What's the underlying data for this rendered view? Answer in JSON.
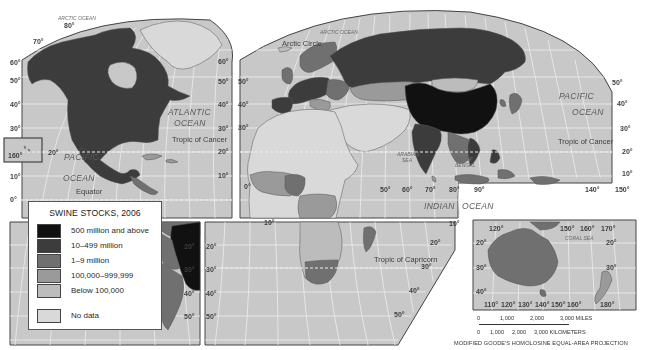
{
  "map": {
    "title": "Swine Stocks, 2006",
    "projection": "MODIFIED GOODE'S HOMOLOSINE EQUAL-AREA PROJECTION",
    "colors": {
      "ocean": "#c8c8c8",
      "graticule": "#eeeeee",
      "border": "#555555",
      "frame": "#444444"
    }
  },
  "legend": {
    "title": "SWINE STOCKS, 2006",
    "items": [
      {
        "label": "500 million and above",
        "color": "#111111"
      },
      {
        "label": "10–499 million",
        "color": "#3c3c3c"
      },
      {
        "label": "1–9 million",
        "color": "#707070"
      },
      {
        "label": "100,000–999,999",
        "color": "#9a9a9a"
      },
      {
        "label": "Below 100,000",
        "color": "#bcbcbc"
      }
    ],
    "no_data": {
      "label": "No data",
      "color": "#d9d9d9"
    }
  },
  "labels": {
    "oceans": {
      "arctic_west": "ARCTIC OCEAN",
      "arctic_east": "ARCTIC OCEAN",
      "atlantic_1": "ATLANTIC",
      "atlantic_2": "OCEAN",
      "pacific_w1": "PACIFIC",
      "pacific_w2": "OCEAN",
      "pacific_e1": "PACIFIC",
      "pacific_e2": "OCEAN",
      "indian_1": "INDIAN",
      "indian_2": "OCEAN",
      "arabian_sea_1": "ARABIAN",
      "arabian_sea_2": "SEA",
      "bay_of_bengal_1": "BAY OF",
      "bay_of_bengal_2": "BENGAL",
      "coral_sea": "CORAL SEA"
    },
    "lines": {
      "arctic_circle": "Arctic Circle",
      "tropic_cancer_w": "Tropic of Cancer",
      "tropic_cancer_e": "Tropic of Cancer",
      "equator": "Equator",
      "tropic_capricorn": "Tropic of Capricorn"
    },
    "degrees": {
      "n80": "80°",
      "n70": "70°",
      "n60": "60°",
      "n50": "50°",
      "n40": "40°",
      "n30": "30°",
      "n20": "20°",
      "n10": "10°",
      "eq": "0°",
      "s10": "10°",
      "s20": "20°",
      "s30": "30°",
      "s40": "40°",
      "s50": "50°",
      "w160": "160°",
      "e0": "0°",
      "e50": "50°",
      "e60": "60°",
      "e70": "70°",
      "e80": "80°",
      "e90": "90°",
      "e140": "140°",
      "e150": "150°",
      "aus_120": "120°",
      "aus_150": "150°",
      "aus_160": "160°",
      "aus_170": "170°",
      "aus_110b": "110°",
      "aus_120b": "120°",
      "aus_130b": "130°",
      "aus_140b": "140°",
      "aus_150b": "150°",
      "aus_160b": "160°",
      "aus_180b": "180°"
    }
  },
  "scale": {
    "miles": [
      "0",
      "1,000",
      "2,000",
      "3,000 MILES"
    ],
    "kilometers": [
      "0",
      "1,000",
      "2,000",
      "3,000 KILOMETERS"
    ]
  }
}
